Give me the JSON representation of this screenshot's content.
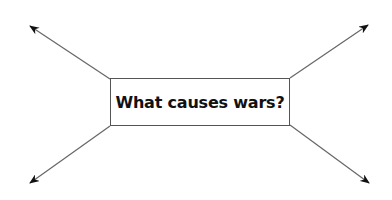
{
  "diagram": {
    "type": "spider-diagram",
    "center": {
      "label": "What causes wars?"
    },
    "arrows": [
      {
        "name": "top-left",
        "from": [
          110,
          79
        ],
        "to": [
          30,
          26
        ]
      },
      {
        "name": "top-right",
        "from": [
          290,
          78
        ],
        "to": [
          368,
          25
        ]
      },
      {
        "name": "bottom-left",
        "from": [
          110,
          126
        ],
        "to": [
          30,
          183
        ]
      },
      {
        "name": "bottom-right",
        "from": [
          290,
          125
        ],
        "to": [
          369,
          183
        ]
      }
    ],
    "colors": {
      "line": "#666666",
      "arrowhead": "#111111",
      "border": "#555555",
      "text": "#111111"
    }
  }
}
